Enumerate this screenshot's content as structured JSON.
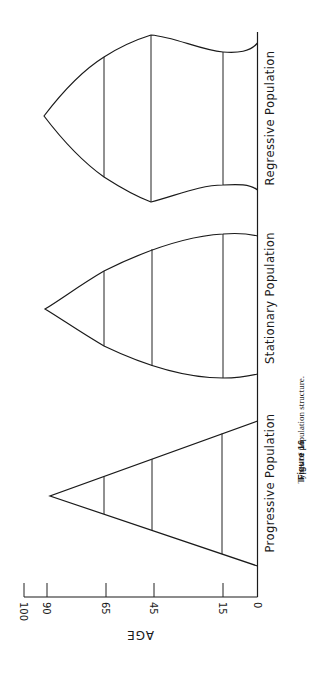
{
  "figure": {
    "caption_number": "Figure 16",
    "caption_text": "Types of population structure.",
    "orientation": "rotated 90° clockwise"
  },
  "axis": {
    "title": "AGE",
    "ticks": [
      "100",
      "90",
      "65",
      "45",
      "15",
      "0"
    ]
  },
  "pyramids": [
    {
      "label": "Progressive Population",
      "shape": "triangle"
    },
    {
      "label": "Stationary Population",
      "shape": "bell"
    },
    {
      "label": "Regressive Population",
      "shape": "urn"
    }
  ],
  "colors": {
    "line": "#1a1a1a",
    "background": "#ffffff"
  }
}
